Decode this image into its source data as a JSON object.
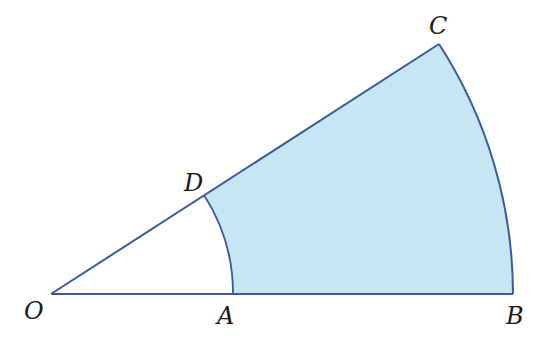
{
  "diagram": {
    "type": "annular-sector",
    "colors": {
      "stroke": "#3a5a9c",
      "fill": "#c5e6f2",
      "label": "#1a1a1a",
      "background": "#ffffff"
    },
    "center": {
      "label": "O",
      "x": 51,
      "y": 294
    },
    "points": [
      {
        "label": "O",
        "x": 51,
        "y": 294
      },
      {
        "label": "A",
        "x": 233,
        "y": 294
      },
      {
        "label": "B",
        "x": 513,
        "y": 294
      },
      {
        "label": "C",
        "x": 439,
        "y": 44
      },
      {
        "label": "D",
        "x": 204,
        "y": 195
      }
    ],
    "inner_radius": 182,
    "outer_radius": 462,
    "angle_deg": 32.8,
    "labels": {
      "O": "O",
      "A": "A",
      "B": "B",
      "C": "C",
      "D": "D"
    }
  }
}
